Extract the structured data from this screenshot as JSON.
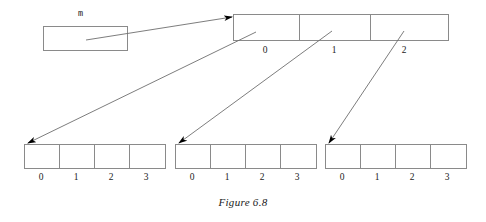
{
  "figure": {
    "caption": "Figure 6.8",
    "background_color": "#ffffff",
    "line_color": "#6e6e6e",
    "box_border_color": "#8a8a8a",
    "arrow_fill_color": "#000000",
    "text_color": "#1a1a1a"
  },
  "pointer_variable": {
    "name": "m",
    "box": {
      "x": 43,
      "y": 26,
      "width": 84,
      "height": 24
    }
  },
  "top_array": {
    "x": 233,
    "y": 14,
    "width": 215,
    "height": 26,
    "cell_count": 3,
    "indices": [
      "0",
      "1",
      "2"
    ],
    "index_label_y": 45,
    "cell_centers": [
      265,
      334,
      404
    ],
    "divider_x": [
      299,
      370
    ]
  },
  "row_arrays": [
    {
      "id": "row-array-0",
      "x": 24,
      "y": 144,
      "width": 141,
      "height": 24,
      "cell_count": 4,
      "indices": [
        "0",
        "1",
        "2",
        "3"
      ],
      "index_label_y": 172,
      "cell_centers": [
        41,
        76,
        111,
        146
      ],
      "divider_x": [
        59,
        94,
        129
      ]
    },
    {
      "id": "row-array-1",
      "x": 175,
      "y": 144,
      "width": 141,
      "height": 24,
      "cell_count": 4,
      "indices": [
        "0",
        "1",
        "2",
        "3"
      ],
      "index_label_y": 172,
      "cell_centers": [
        192,
        227,
        262,
        297
      ],
      "divider_x": [
        210,
        245,
        280
      ]
    },
    {
      "id": "row-array-2",
      "x": 325,
      "y": 144,
      "width": 141,
      "height": 24,
      "cell_count": 4,
      "indices": [
        "0",
        "1",
        "2",
        "3"
      ],
      "index_label_y": 172,
      "cell_centers": [
        342,
        377,
        412,
        447
      ],
      "divider_x": [
        360,
        395,
        430
      ]
    }
  ],
  "arrows": [
    {
      "id": "arrow-m-to-top-array",
      "from_label": "m box",
      "to_label": "top array",
      "x1": 86,
      "y1": 40,
      "x2": 232,
      "y2": 17
    },
    {
      "id": "arrow-top0-to-row0",
      "from_label": "top array cell 0",
      "to_label": "row array 0",
      "x1": 256,
      "y1": 32,
      "x2": 28,
      "y2": 143
    },
    {
      "id": "arrow-top1-to-row1",
      "from_label": "top array cell 1",
      "to_label": "row array 1",
      "x1": 332,
      "y1": 31,
      "x2": 179,
      "y2": 143
    },
    {
      "id": "arrow-top2-to-row2",
      "from_label": "top array cell 2",
      "to_label": "row array 2",
      "x1": 404,
      "y1": 31,
      "x2": 329,
      "y2": 143
    }
  ]
}
